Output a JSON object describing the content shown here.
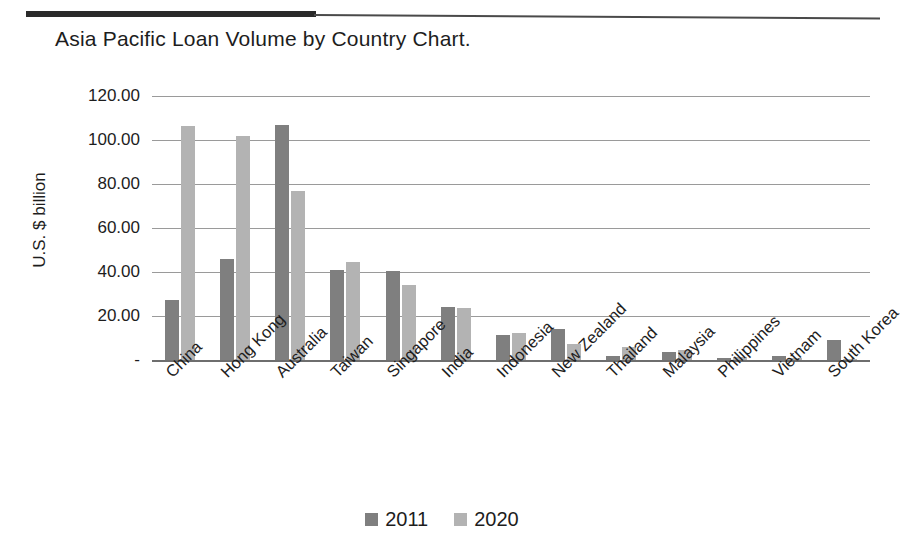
{
  "header": {
    "rule_present": true
  },
  "title": "Asia Pacific Loan Volume by Country Chart.",
  "axes": {
    "y_axis_title": "U.S. $ billion",
    "y_tick_labels": [
      "120.00",
      "100.00",
      "80.00",
      "60.00",
      "40.00",
      "20.00",
      "-"
    ]
  },
  "legend": {
    "items": [
      {
        "label": "2011",
        "color": "#7f7f7f"
      },
      {
        "label": "2020",
        "color": "#b3b3b3"
      }
    ]
  },
  "colors": {
    "series_2011": "#7f7f7f",
    "series_2020": "#b3b3b3",
    "gridline": "#9a9a9a",
    "axis": "#6e6e6e",
    "text": "#1d1d1d",
    "rule": "#2a2a2a"
  },
  "chart_data": {
    "type": "bar",
    "title": "Asia Pacific Loan Volume by Country Chart.",
    "xlabel": "",
    "ylabel": "U.S. $ billion",
    "ylim": [
      0,
      120
    ],
    "ytick_interval": 20,
    "grid": true,
    "legend_position": "bottom",
    "categories": [
      "China",
      "Hong Kong",
      "Australia",
      "Taiwan",
      "Singapore",
      "India",
      "Indonesia",
      "New Zealand",
      "Thailand",
      "Malaysia",
      "Philippines",
      "Vietnam",
      "South Korea"
    ],
    "series": [
      {
        "name": "2011",
        "color": "#7f7f7f",
        "values": [
          27.5,
          46.0,
          107.0,
          41.0,
          40.5,
          24.0,
          11.5,
          14.0,
          2.0,
          3.5,
          1.0,
          2.0,
          9.0
        ]
      },
      {
        "name": "2020",
        "color": "#b3b3b3",
        "values": [
          106.5,
          102.0,
          77.0,
          44.5,
          34.0,
          23.5,
          12.5,
          7.5,
          6.0,
          4.5,
          1.5,
          1.0,
          0.3
        ]
      }
    ]
  }
}
